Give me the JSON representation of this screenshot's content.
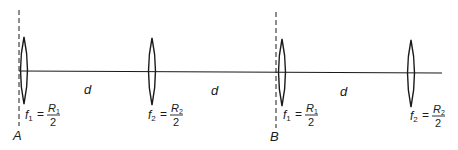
{
  "diagram": {
    "colors": {
      "stroke": "#1a1a1a",
      "background": "#ffffff"
    },
    "planes": [
      {
        "label": "A"
      },
      {
        "label": "B"
      }
    ],
    "spacing_labels": [
      "d",
      "d",
      "d"
    ],
    "lenses": [
      {
        "f": "f",
        "f_sub": "1",
        "eq": "=",
        "num": "R",
        "num_sub": "1",
        "den": "2"
      },
      {
        "f": "f",
        "f_sub": "2",
        "eq": "=",
        "num": "R",
        "num_sub": "2",
        "den": "2"
      },
      {
        "f": "f",
        "f_sub": "1",
        "eq": "=",
        "num": "R",
        "num_sub": "1",
        "den": "2"
      },
      {
        "f": "f",
        "f_sub": "2",
        "eq": "=",
        "num": "R",
        "num_sub": "2",
        "den": "2"
      }
    ]
  }
}
